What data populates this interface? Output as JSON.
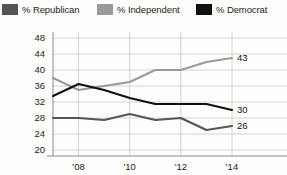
{
  "legend": {
    "items": [
      {
        "label": "% Republican",
        "color": "#555555",
        "key": "republican"
      },
      {
        "label": "% Independent",
        "color": "#9a9a9a",
        "key": "independent"
      },
      {
        "label": "% Democrat",
        "color": "#111111",
        "key": "democrat"
      }
    ]
  },
  "axis": {
    "y_ticks": [
      "48",
      "44",
      "40",
      "36",
      "32",
      "28",
      "24",
      "20"
    ],
    "x_ticks": [
      "'08",
      "'10",
      "'12",
      "'14"
    ]
  },
  "end_labels": {
    "independent": "43",
    "democrat": "30",
    "republican": "26"
  },
  "chart_data": {
    "type": "line",
    "title": "",
    "subtitle": "",
    "xlabel": "",
    "ylabel": "",
    "grid": true,
    "legend_position": "top",
    "x": [
      2007,
      2008,
      2009,
      2010,
      2011,
      2012,
      2013,
      2014
    ],
    "xlim": [
      2007,
      2014
    ],
    "ylim": [
      20,
      48
    ],
    "x_tick_values": [
      2008,
      2010,
      2012,
      2014
    ],
    "x_tick_labels": [
      "'08",
      "'10",
      "'12",
      "'14"
    ],
    "y_tick_values": [
      20,
      24,
      28,
      32,
      36,
      40,
      44,
      48
    ],
    "y_tick_labels": [
      "20",
      "24",
      "28",
      "32",
      "36",
      "40",
      "44",
      "48"
    ],
    "series": [
      {
        "name": "% Independent",
        "color": "#9a9a9a",
        "values": [
          38,
          35,
          36,
          37,
          40,
          40,
          42,
          43
        ],
        "end_label": "43"
      },
      {
        "name": "% Democrat",
        "color": "#111111",
        "values": [
          33.5,
          36.5,
          35,
          33,
          31.5,
          31.5,
          31.5,
          30
        ],
        "end_label": "30"
      },
      {
        "name": "% Republican",
        "color": "#555555",
        "values": [
          28,
          28,
          27.5,
          29,
          27.5,
          28,
          25,
          26
        ],
        "end_label": "26"
      }
    ]
  }
}
